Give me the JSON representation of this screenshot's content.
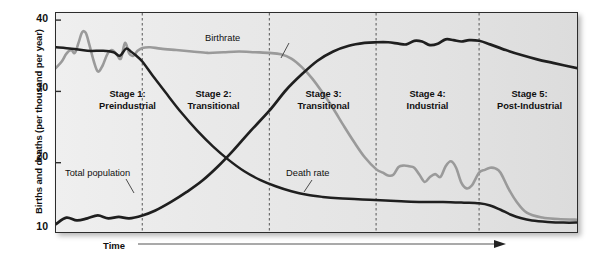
{
  "chart_data": {
    "type": "line",
    "xlabel": "Time",
    "ylabel": "Births and deaths (per thousand per year)",
    "ylim": [
      10,
      41
    ],
    "yticks": [
      40,
      30,
      20,
      10
    ],
    "xlim": [
      0,
      100
    ],
    "grid": false,
    "legend_position": "inline-annotations",
    "annotations": [
      {
        "name": "Birthrate",
        "text": "Birthrate",
        "x": 40,
        "y": 38.2
      },
      {
        "name": "Death rate",
        "text": "Death rate",
        "x": 51,
        "y": 18.9
      },
      {
        "name": "Total population",
        "text": "Total population",
        "x": 9,
        "y": 19.8
      }
    ],
    "stage_boundaries": [
      16.5,
      40.8,
      61.2,
      80.9
    ],
    "stages": [
      {
        "number": 1,
        "name": "Stage 1:",
        "subtitle": "Preindustrial",
        "center_x": 8.2,
        "label_y": 29.2
      },
      {
        "number": 2,
        "name": "Stage 2:",
        "subtitle": "Transitional",
        "center_x": 28.5,
        "label_y": 29.2
      },
      {
        "number": 3,
        "name": "Stage 3:",
        "subtitle": "Transitional",
        "center_x": 51.0,
        "label_y": 29.2
      },
      {
        "number": 4,
        "name": "Stage 4:",
        "subtitle": "Industrial",
        "center_x": 71.0,
        "label_y": 29.2
      },
      {
        "number": 5,
        "name": "Stage 5:",
        "subtitle": "Post-Industrial",
        "center_x": 90.5,
        "label_y": 29.2
      }
    ],
    "series": [
      {
        "name": "Birthrate",
        "color": "#9a9a9a",
        "x": [
          0.0,
          1.1,
          2.0,
          2.9,
          3.6,
          4.3,
          5.0,
          5.7,
          6.4,
          7.2,
          8.0,
          8.9,
          9.8,
          10.7,
          11.6,
          12.4,
          13.2,
          14.0,
          14.8,
          15.6,
          16.5,
          18.0,
          20.0,
          23.0,
          26.0,
          29.0,
          32.0,
          35.0,
          38.0,
          40.8,
          43.0,
          45.0,
          47.0,
          49.0,
          51.0,
          53.0,
          55.0,
          57.0,
          59.0,
          61.2,
          62.5,
          63.5,
          64.5,
          65.5,
          66.5,
          67.5,
          68.5,
          69.5,
          70.5,
          71.5,
          72.5,
          73.5,
          74.5,
          75.5,
          76.5,
          77.5,
          78.5,
          79.5,
          80.9,
          82.0,
          83.0,
          84.0,
          85.0,
          86.5,
          88.0,
          90.0,
          93.0,
          96.0,
          100.0
        ],
        "y": [
          33.3,
          34.2,
          35.3,
          35.8,
          35.4,
          36.8,
          38.3,
          38.2,
          36.5,
          34.3,
          32.8,
          33.6,
          35.2,
          35.8,
          35.2,
          34.6,
          36.8,
          35.3,
          35.0,
          35.7,
          36.1,
          36.2,
          36.0,
          35.8,
          35.6,
          35.4,
          35.5,
          35.6,
          35.5,
          35.4,
          35.2,
          34.6,
          33.4,
          31.8,
          29.8,
          27.6,
          25.2,
          22.9,
          20.8,
          19.1,
          18.6,
          18.2,
          18.3,
          19.4,
          19.6,
          19.5,
          19.3,
          18.3,
          17.3,
          18.0,
          18.4,
          18.0,
          19.5,
          20.2,
          19.3,
          17.2,
          16.4,
          16.8,
          18.6,
          19.0,
          19.3,
          19.2,
          18.6,
          16.4,
          14.6,
          13.0,
          12.3,
          12.1,
          12.0
        ]
      },
      {
        "name": "Death rate",
        "color": "#1f1f1f",
        "x": [
          0.0,
          3.0,
          6.0,
          9.0,
          11.0,
          12.2,
          13.4,
          14.3,
          15.2,
          16.5,
          18.5,
          21.0,
          24.0,
          27.0,
          30.0,
          33.0,
          36.0,
          39.0,
          42.0,
          45.0,
          48.0,
          51.0,
          54.0,
          57.0,
          60.0,
          63.0,
          66.0,
          70.0,
          74.0,
          78.0,
          80.9,
          83.0,
          85.0,
          87.0,
          89.0,
          91.0,
          94.0,
          97.0,
          100.0
        ],
        "y": [
          36.2,
          36.0,
          35.7,
          35.7,
          35.5,
          35.0,
          36.0,
          35.6,
          35.1,
          34.2,
          32.2,
          29.8,
          27.0,
          24.5,
          22.3,
          20.4,
          18.8,
          17.6,
          16.7,
          16.0,
          15.5,
          15.2,
          15.0,
          14.9,
          14.8,
          14.7,
          14.6,
          14.5,
          14.5,
          14.4,
          14.3,
          14.0,
          13.4,
          12.7,
          12.2,
          11.9,
          11.7,
          11.6,
          11.6
        ]
      },
      {
        "name": "Total population",
        "color": "#1f1f1f",
        "x": [
          0.0,
          2.0,
          4.0,
          6.0,
          8.0,
          10.0,
          12.0,
          14.0,
          16.5,
          19.0,
          22.0,
          25.0,
          28.0,
          31.0,
          34.0,
          37.0,
          40.8,
          44.0,
          47.0,
          50.0,
          53.0,
          56.0,
          59.0,
          61.2,
          63.5,
          65.5,
          67.0,
          68.5,
          70.0,
          71.5,
          73.0,
          74.5,
          76.0,
          77.5,
          79.0,
          80.9,
          83.0,
          86.0,
          89.0,
          92.0,
          95.0,
          100.0
        ],
        "y": [
          11.4,
          12.3,
          11.9,
          12.2,
          12.6,
          12.2,
          12.4,
          12.2,
          12.6,
          13.3,
          14.5,
          15.9,
          17.5,
          19.5,
          21.8,
          24.3,
          27.3,
          30.2,
          32.4,
          34.3,
          35.6,
          36.4,
          36.8,
          36.9,
          36.9,
          36.7,
          36.6,
          37.1,
          37.0,
          36.5,
          36.7,
          37.3,
          37.2,
          37.0,
          37.2,
          37.1,
          36.6,
          35.8,
          35.1,
          34.5,
          34.0,
          33.2
        ]
      }
    ]
  },
  "axis": {
    "ylabel": "Births and deaths (per thousand per year)",
    "xlabel": "Time",
    "yticks": [
      "40",
      "30",
      "20",
      "10"
    ]
  },
  "stages": [
    {
      "title": "Stage 1:",
      "subtitle": "Preindustrial"
    },
    {
      "title": "Stage 2:",
      "subtitle": "Transitional"
    },
    {
      "title": "Stage 3:",
      "subtitle": "Transitional"
    },
    {
      "title": "Stage 4:",
      "subtitle": "Industrial"
    },
    {
      "title": "Stage 5:",
      "subtitle": "Post-Industrial"
    }
  ],
  "annotations": {
    "birthrate": "Birthrate",
    "death_rate": "Death rate",
    "total_population": "Total population"
  },
  "colors": {
    "birthrate_line": "#9a9a9a",
    "death_rate_line": "#1f1f1f",
    "total_population_line": "#1f1f1f",
    "plot_background": "#e8e8e8",
    "frame": "#2c2c2c",
    "divider": "#6e6e6e"
  }
}
